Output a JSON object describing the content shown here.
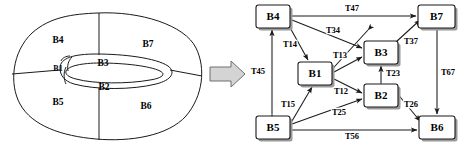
{
  "figure": {
    "title": "",
    "transform_arrow": "right-block-arrow"
  },
  "left_diagram": {
    "name": "partitioned-torus-region",
    "regions": [
      {
        "id": "B1",
        "label": "B1"
      },
      {
        "id": "B2",
        "label": "B2"
      },
      {
        "id": "B3",
        "label": "B3"
      },
      {
        "id": "B4",
        "label": "B4"
      },
      {
        "id": "B5",
        "label": "B5"
      },
      {
        "id": "B6",
        "label": "B6"
      },
      {
        "id": "B7",
        "label": "B7"
      }
    ]
  },
  "right_diagram": {
    "name": "adjacency-graph",
    "nodes": [
      {
        "id": "B4",
        "label": "B4",
        "x": 256,
        "y": 5,
        "w": 34,
        "h": 23
      },
      {
        "id": "B7",
        "label": "B7",
        "x": 418,
        "y": 5,
        "w": 37,
        "h": 23
      },
      {
        "id": "B3",
        "label": "B3",
        "x": 364,
        "y": 41,
        "w": 34,
        "h": 23
      },
      {
        "id": "B1",
        "label": "B1",
        "x": 298,
        "y": 62,
        "w": 34,
        "h": 23
      },
      {
        "id": "B2",
        "label": "B2",
        "x": 364,
        "y": 84,
        "w": 34,
        "h": 23
      },
      {
        "id": "B5",
        "label": "B5",
        "x": 256,
        "y": 116,
        "w": 34,
        "h": 23
      },
      {
        "id": "B6",
        "label": "B6",
        "x": 419,
        "y": 116,
        "w": 36,
        "h": 23
      }
    ],
    "edges": [
      {
        "id": "T47",
        "label": "T47",
        "from": "B4",
        "to": "B7",
        "lx": 352,
        "ly": 11
      },
      {
        "id": "T34",
        "label": "T34",
        "from": "B4",
        "to": "B3",
        "lx": 332,
        "ly": 32
      },
      {
        "id": "T14",
        "label": "T14",
        "from": "B4",
        "to": "B1",
        "lx": 290,
        "ly": 45
      },
      {
        "id": "T13",
        "label": "T13",
        "from": "B1",
        "to": "B3",
        "lx": 339,
        "ly": 57
      },
      {
        "id": "T37",
        "label": "T37",
        "from": "B3",
        "to": "B7",
        "lx": 412,
        "ly": 42
      },
      {
        "id": "T23",
        "label": "T23",
        "from": "B2",
        "to": "B3",
        "lx": 392,
        "ly": 74
      },
      {
        "id": "T67",
        "label": "T67",
        "from": "B6",
        "to": "B7",
        "lx": 447,
        "ly": 73
      },
      {
        "id": "T45",
        "label": "T45",
        "from": "B4",
        "to": "B5",
        "lx": 258,
        "ly": 72
      },
      {
        "id": "T12",
        "label": "T12",
        "from": "B1",
        "to": "B2",
        "lx": 340,
        "ly": 92
      },
      {
        "id": "T15",
        "label": "T15",
        "from": "B5",
        "to": "B1",
        "lx": 288,
        "ly": 105
      },
      {
        "id": "T25",
        "label": "T25",
        "from": "B5",
        "to": "B2",
        "lx": 338,
        "ly": 113
      },
      {
        "id": "T26",
        "label": "T26",
        "from": "B2",
        "to": "B6",
        "lx": 410,
        "ly": 105
      },
      {
        "id": "T56",
        "label": "T56",
        "from": "B5",
        "to": "B6",
        "lx": 352,
        "ly": 136
      }
    ]
  }
}
